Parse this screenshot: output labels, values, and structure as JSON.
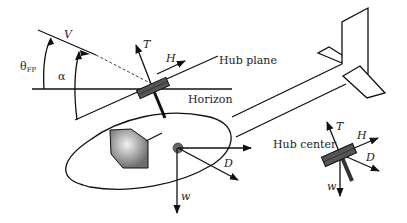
{
  "diagram": {
    "labels": {
      "theta_fp": "θ",
      "theta_fp_sub": "FP",
      "alpha": "α",
      "velocity": "V",
      "thrust": "T",
      "h_force": "H",
      "drag": "D",
      "weight": "w",
      "hub_plane": "Hub plane",
      "horizon": "Horizon",
      "hub_center": "Hub center"
    },
    "inset_labels": {
      "thrust": "T",
      "h_force": "H",
      "drag": "D",
      "weight": "w"
    },
    "colors": {
      "line": "#111111",
      "hub": "#555555",
      "canopy": "#9a9a9a",
      "background": "#ffffff"
    }
  }
}
